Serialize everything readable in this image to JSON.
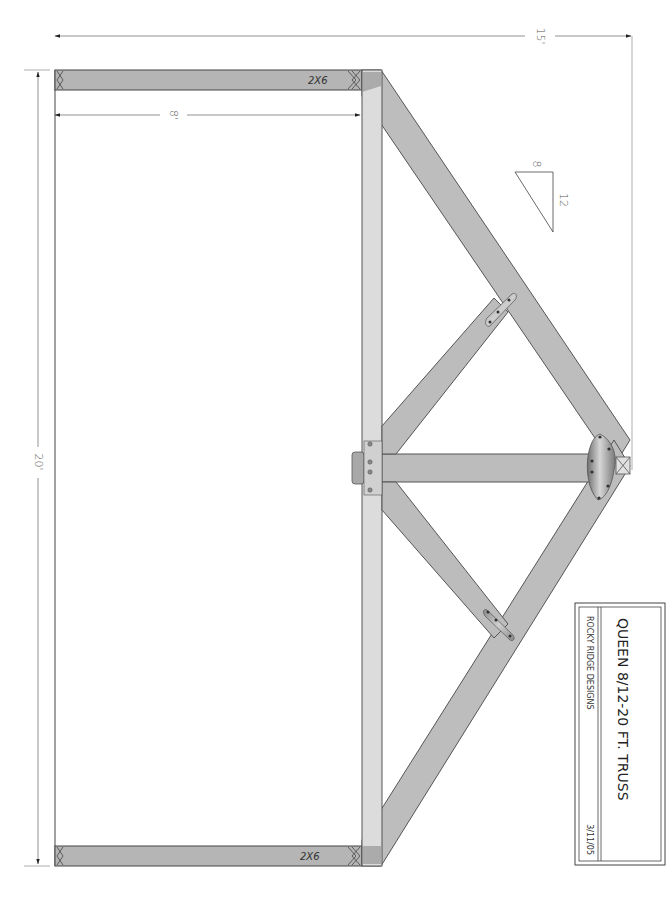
{
  "drawing": {
    "title": "QUEEN 8/12-20 FT. TRUSS",
    "company": "ROCKY RIDGE DESIGNS",
    "date": "3/11/05"
  },
  "dimensions": {
    "span": "20'",
    "height": "15'",
    "overhang": "8'"
  },
  "pitch": {
    "rise": "8",
    "run": "12"
  },
  "lumber": {
    "top_tail": "2X6",
    "bottom_tail": "2X6"
  },
  "colors": {
    "lumber": "#b9b9b9",
    "lumber_light": "#dcdcdc",
    "outline": "#555555",
    "plate": "#9a9a9a",
    "dim_line": "#777777"
  }
}
